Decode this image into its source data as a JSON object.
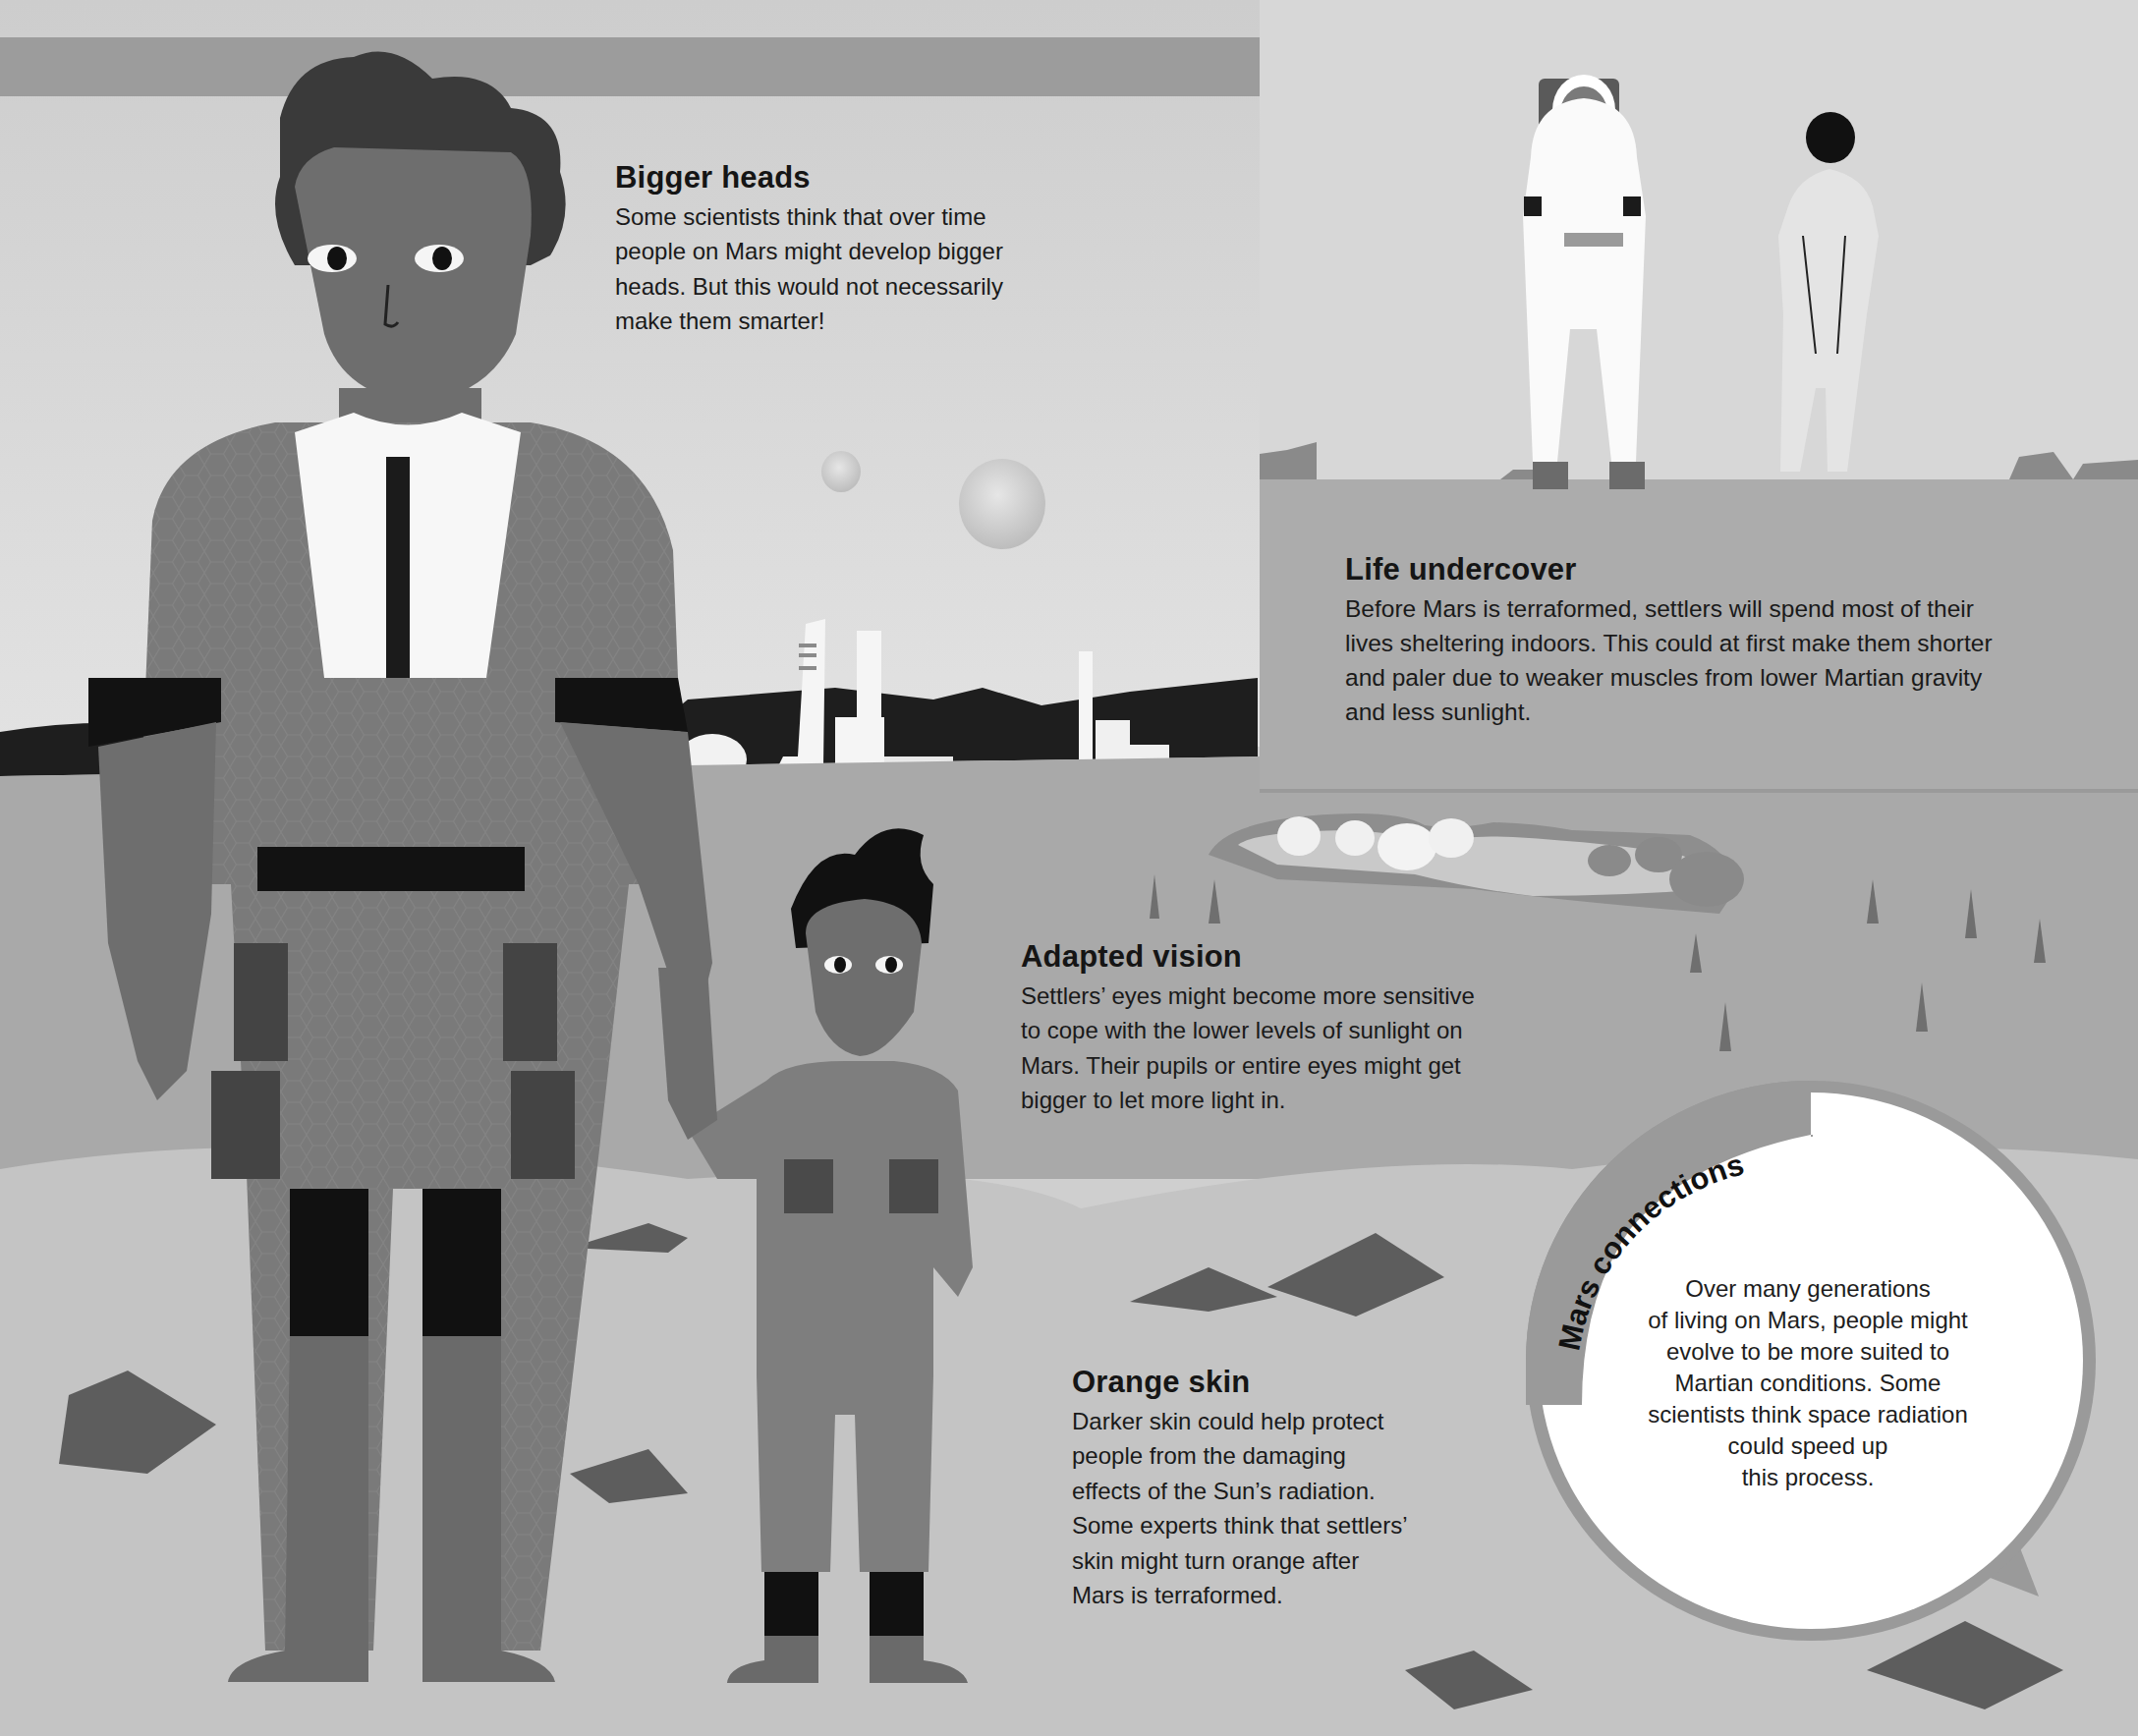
{
  "page": {
    "background_color": "#cfcfcf",
    "header_band_color": "#9c9c9c"
  },
  "sections": {
    "bigger_heads": {
      "title": "Bigger heads",
      "lines": [
        "Some scientists think that over time",
        "people on Mars might develop bigger",
        "heads. But this would not necessarily",
        "make them smarter!"
      ]
    },
    "life_undercover": {
      "title": "Life undercover",
      "lines": [
        "Before Mars is terraformed, settlers will spend most of their",
        "lives sheltering indoors. This could at first make them shorter",
        "and paler due to weaker muscles from lower Martian gravity",
        "and less sunlight."
      ]
    },
    "adapted_vision": {
      "title": "Adapted vision",
      "lines": [
        "Settlers’ eyes might become more sensitive",
        "to cope with the lower levels of sunlight on",
        "Mars. Their pupils or entire eyes might get",
        "bigger to let more light in."
      ]
    },
    "orange_skin": {
      "title": "Orange skin",
      "lines": [
        "Darker skin could help protect",
        "people from the damaging",
        "effects of the Sun’s radiation.",
        "Some experts think that settlers’",
        "skin might turn orange after",
        "Mars is terraformed."
      ]
    }
  },
  "callout": {
    "label": "Mars connections",
    "lines": [
      "Over many generations",
      "of living on Mars, people might",
      "evolve to be more suited to",
      "Martian conditions. Some",
      "scientists think space radiation",
      "could speed up",
      "this process."
    ],
    "ring_color": "#9a9a9a",
    "fill_color": "#ffffff"
  },
  "illustrations": {
    "adult_settler": "tall adult settler in honeycomb-pattern suit",
    "child_settler": "child settler holding adult's hand",
    "astronaut_classic": "astronaut in white spacesuit",
    "astronaut_sleek": "astronaut in sleek fitted spacesuit",
    "moons": "two moons in sky",
    "colony": "white towers of Mars colony",
    "crater_base": "domed habitats inside crater"
  }
}
